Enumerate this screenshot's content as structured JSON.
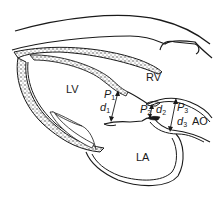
{
  "figure": {
    "chambers": {
      "lv": "LV",
      "rv": "RV",
      "la": "LA",
      "ao": "AO"
    },
    "measurements": [
      {
        "p": "P",
        "p_sub": "1",
        "d": "d",
        "d_sub": "1"
      },
      {
        "p": "P",
        "p_sub": "2",
        "d": "d",
        "d_sub": "2"
      },
      {
        "p": "P",
        "p_sub": "3",
        "d": "d",
        "d_sub": "3"
      }
    ],
    "colors": {
      "ink": "#1a1a1a",
      "background": "#ffffff",
      "stipple": "#8a8a8a"
    }
  }
}
